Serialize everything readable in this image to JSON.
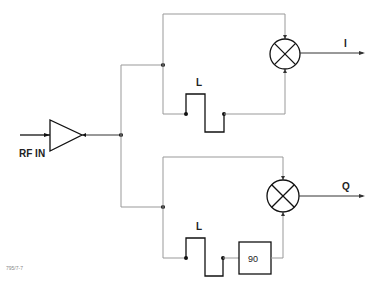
{
  "diagram": {
    "input_label": "RF IN",
    "outputs": {
      "i_label": "I",
      "q_label": "Q"
    },
    "delay_line_upper_label": "L",
    "delay_line_lower_label": "L",
    "phase_shifter_label": "90",
    "footnote": "795/7-7",
    "components": [
      {
        "type": "amplifier",
        "name": "input-amplifier"
      },
      {
        "type": "mixer",
        "name": "mixer-i"
      },
      {
        "type": "mixer",
        "name": "mixer-q"
      },
      {
        "type": "delay-line",
        "name": "delay-line-upper",
        "label": "L"
      },
      {
        "type": "delay-line",
        "name": "delay-line-lower",
        "label": "L"
      },
      {
        "type": "phase-shifter",
        "name": "phase-shifter-90",
        "label": "90"
      }
    ],
    "colors": {
      "line": "#333333",
      "background": "#ffffff"
    }
  }
}
